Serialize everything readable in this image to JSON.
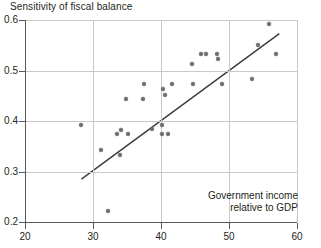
{
  "chart_data": {
    "type": "scatter",
    "title": "Sensitivity of fiscal balance",
    "xlabel": "Government income relative to GDP",
    "ylabel": "Sensitivity of fiscal balance",
    "annotation_line1": "Government income",
    "annotation_line2": "relative to GDP",
    "xlim": [
      20,
      60
    ],
    "ylim": [
      0.2,
      0.6
    ],
    "xticks": [
      "20",
      "30",
      "40",
      "50",
      "60"
    ],
    "xtick_values": [
      20,
      30,
      40,
      50,
      60
    ],
    "yticks": [
      "0.2",
      "0.3",
      "0.4",
      "0.5",
      "0.6"
    ],
    "ytick_values": [
      0.2,
      0.3,
      0.4,
      0.5,
      0.6
    ],
    "grid": "both",
    "legend": "none",
    "point_color": "#6d6e71",
    "line_color": "#3b3b3b",
    "axis_color": "#58595b",
    "grid_color": "#c9c9c9",
    "points": [
      [
        28.3,
        0.393
      ],
      [
        31.2,
        0.342
      ],
      [
        32.2,
        0.222
      ],
      [
        33.6,
        0.374
      ],
      [
        34.1,
        0.383
      ],
      [
        33.9,
        0.333
      ],
      [
        35.1,
        0.374
      ],
      [
        34.8,
        0.443
      ],
      [
        37.4,
        0.443
      ],
      [
        37.5,
        0.473
      ],
      [
        38.7,
        0.384
      ],
      [
        40.1,
        0.393
      ],
      [
        40.2,
        0.374
      ],
      [
        41.0,
        0.374
      ],
      [
        40.3,
        0.463
      ],
      [
        40.6,
        0.452
      ],
      [
        41.6,
        0.473
      ],
      [
        44.6,
        0.513
      ],
      [
        44.7,
        0.473
      ],
      [
        45.9,
        0.533
      ],
      [
        46.6,
        0.533
      ],
      [
        48.2,
        0.533
      ],
      [
        48.4,
        0.523
      ],
      [
        49.0,
        0.473
      ],
      [
        53.4,
        0.483
      ],
      [
        54.3,
        0.551
      ],
      [
        55.9,
        0.593
      ],
      [
        56.9,
        0.533
      ]
    ],
    "trend_line": {
      "x0": 28.3,
      "y0": 0.285,
      "x1": 57.4,
      "y1": 0.573
    }
  }
}
